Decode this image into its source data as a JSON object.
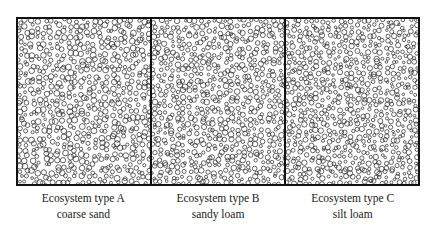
{
  "figure": {
    "panels": [
      {
        "id": "A",
        "title": "Ecosystem type A",
        "soil": "coarse sand",
        "seed": 11,
        "radius": 2.3,
        "spacing": 6.2
      },
      {
        "id": "B",
        "title": "Ecosystem type B",
        "soil": "sandy loam",
        "seed": 29,
        "radius": 2.2,
        "spacing": 6.0
      },
      {
        "id": "C",
        "title": "Ecosystem type C",
        "soil": "silt loam",
        "seed": 47,
        "radius": 2.1,
        "spacing": 5.8
      }
    ],
    "stroke_color": "#333333",
    "border_color": "#111111"
  }
}
